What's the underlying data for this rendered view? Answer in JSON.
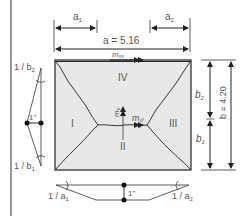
{
  "labels": {
    "a1": "a",
    "a1_sub": "1",
    "a2": "a",
    "a2_sub": "2",
    "a_total": "a = 5.16",
    "b_total": "b = 4.20",
    "b1": "b",
    "b1_sub": "1",
    "b2": "b",
    "b2_sub": "2",
    "m_xs": "m",
    "m_xs_sub": "xs",
    "m_xf": "m",
    "m_xf_sub": "xf",
    "m_y": "m",
    "m_y_sub": "y",
    "region_I": "I",
    "region_II": "II",
    "region_III": "III",
    "region_IV": "IV",
    "inv_b2": "1 / b",
    "inv_b2_sub": "2",
    "inv_b1": "1 / b",
    "inv_b1_sub": "1",
    "inv_a1": "1 / a",
    "inv_a1_sub": "1",
    "inv_a2": "1 / a",
    "inv_a2_sub": "2",
    "unit_left": "1\"",
    "unit_bottom": "1\""
  },
  "colors": {
    "slab_fill": "#e8e8e8",
    "line": "#222222",
    "text": "#555555"
  }
}
